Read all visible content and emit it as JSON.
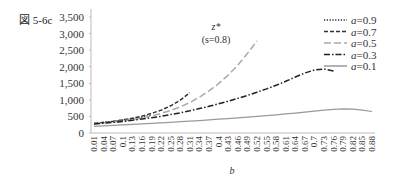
{
  "figure_label": "図 5-6c",
  "chart_data": {
    "type": "line",
    "title": "",
    "annotation": [
      "z*",
      "(s=0.8)"
    ],
    "xlabel": "b",
    "ylabel": "",
    "ylim": [
      0,
      3500
    ],
    "yticks": [
      0,
      500,
      1000,
      1500,
      2000,
      2500,
      3000,
      3500
    ],
    "ytick_labels": [
      "0",
      "500",
      "1,000",
      "1,500",
      "2,000",
      "2,500",
      "3,000",
      "3,500"
    ],
    "x": [
      0.01,
      0.04,
      0.07,
      0.1,
      0.13,
      0.16,
      0.19,
      0.22,
      0.25,
      0.28,
      0.31,
      0.34,
      0.37,
      0.4,
      0.43,
      0.46,
      0.49,
      0.52,
      0.55,
      0.58,
      0.61,
      0.64,
      0.67,
      0.7,
      0.73,
      0.76,
      0.79,
      0.82,
      0.85,
      0.88
    ],
    "xtick_labels": [
      "0.01",
      "0.04",
      "0.07",
      "0.1",
      "0.13",
      "0.16",
      "0.19",
      "0.22",
      "0.25",
      "0.28",
      "0.31",
      "0.34",
      "0.37",
      "0.4",
      "0.43",
      "0.46",
      "0.49",
      "0.52",
      "0.55",
      "0.58",
      "0.61",
      "0.64",
      "0.67",
      "0.7",
      "0.73",
      "0.76",
      "0.79",
      "0.82",
      "0.85",
      "0.88"
    ],
    "grid": false,
    "legend_position": "upper right",
    "series": [
      {
        "name": "a=0.9",
        "style": "dotted",
        "color": "#222222",
        "values": [
          290,
          320,
          350,
          390,
          430,
          480,
          540,
          null,
          null,
          null,
          null,
          null,
          null,
          null,
          null,
          null,
          null,
          null,
          null,
          null,
          null,
          null,
          null,
          null,
          null,
          null,
          null,
          null,
          null,
          null
        ]
      },
      {
        "name": "a=0.7",
        "style": "dashed",
        "color": "#333333",
        "values": [
          290,
          320,
          350,
          395,
          445,
          510,
          590,
          690,
          820,
          990,
          1220,
          null,
          null,
          null,
          null,
          null,
          null,
          null,
          null,
          null,
          null,
          null,
          null,
          null,
          null,
          null,
          null,
          null,
          null,
          null
        ]
      },
      {
        "name": "a=0.5",
        "style": "long-dash",
        "color": "#aaaaaa",
        "values": [
          280,
          305,
          330,
          365,
          405,
          455,
          515,
          590,
          680,
          790,
          920,
          1080,
          1270,
          1490,
          1750,
          2050,
          2400,
          2780,
          null,
          null,
          null,
          null,
          null,
          null,
          null,
          null,
          null,
          null,
          null,
          null
        ]
      },
      {
        "name": "a=0.3",
        "style": "dash-dot",
        "color": "#222222",
        "values": [
          270,
          295,
          320,
          350,
          385,
          420,
          460,
          505,
          555,
          610,
          670,
          735,
          805,
          880,
          960,
          1045,
          1135,
          1230,
          1330,
          1440,
          1560,
          1690,
          1810,
          1900,
          1930,
          1870,
          null,
          null,
          null,
          null
        ]
      },
      {
        "name": "a=0.1",
        "style": "solid",
        "color": "#999999",
        "values": [
          200,
          215,
          230,
          245,
          260,
          275,
          290,
          305,
          320,
          340,
          355,
          375,
          395,
          415,
          435,
          455,
          480,
          500,
          525,
          550,
          575,
          600,
          630,
          660,
          690,
          715,
          730,
          720,
          690,
          650
        ]
      }
    ]
  }
}
